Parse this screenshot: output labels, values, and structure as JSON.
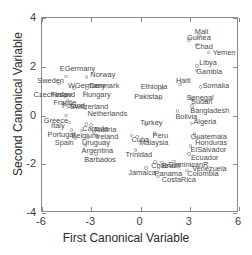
{
  "chart_data": {
    "type": "scatter",
    "title": "",
    "xlabel": "First Canonical Variable",
    "ylabel": "Second Canonical Variable",
    "xlim": [
      -6,
      6
    ],
    "ylim": [
      -4,
      4
    ],
    "xticks": [
      "-6",
      "-3",
      "0",
      "3",
      "6"
    ],
    "xtick_values": [
      -6,
      -3,
      0,
      3,
      6
    ],
    "yticks": [
      "4",
      "2",
      "0",
      "-2",
      "-4"
    ],
    "ytick_values": [
      4,
      2,
      0,
      -2,
      -4
    ],
    "grid": false,
    "legend": null,
    "marker": "open-circle",
    "marker_color": "#9b9b9b",
    "label_color": "#4a4a4a",
    "points": [
      {
        "label": "EGermany",
        "x": -4.55,
        "y": 1.6,
        "lx": -6,
        "ly": -9
      },
      {
        "label": "Sweden",
        "x": -4.95,
        "y": 1.32,
        "lx": -22,
        "ly": -3
      },
      {
        "label": "Norway",
        "x": -3.3,
        "y": 1.58,
        "lx": 4,
        "ly": -3
      },
      {
        "label": "WGermany",
        "x": -4.05,
        "y": 1.12,
        "lx": -6,
        "ly": -3
      },
      {
        "label": "Denmark",
        "x": -3.25,
        "y": 1.12,
        "lx": 2,
        "ly": -3
      },
      {
        "label": "Hungary",
        "x": -3.4,
        "y": 0.95,
        "lx": -2,
        "ly": 2
      },
      {
        "label": "Czechoslov.",
        "x": -5.05,
        "y": 0.82,
        "lx": -24,
        "ly": -2
      },
      {
        "label": "Finland",
        "x": -4.6,
        "y": 0.8,
        "lx": -14,
        "ly": -2
      },
      {
        "label": "France",
        "x": -4.45,
        "y": 0.62,
        "lx": -14,
        "ly": 2
      },
      {
        "label": "Poland",
        "x": -4.3,
        "y": 0.55,
        "lx": -8,
        "ly": 3
      },
      {
        "label": "Switzerland",
        "x": -4.05,
        "y": 0.52,
        "lx": -4,
        "ly": 3
      },
      {
        "label": "Netherlands",
        "x": -3.35,
        "y": 0.28,
        "lx": 2,
        "ly": 4
      },
      {
        "label": "Greece",
        "x": -4.55,
        "y": 0.0,
        "lx": -22,
        "ly": 4
      },
      {
        "label": "Italy",
        "x": -4.35,
        "y": -0.28,
        "lx": -18,
        "ly": 3
      },
      {
        "label": "Canada",
        "x": -3.3,
        "y": -0.35,
        "lx": -4,
        "ly": 4
      },
      {
        "label": "Austria",
        "x": -3.0,
        "y": -0.38,
        "lx": 2,
        "ly": 4
      },
      {
        "label": "Portugal",
        "x": -4.2,
        "y": -0.6,
        "lx": -24,
        "ly": 4
      },
      {
        "label": "Belgium",
        "x": -3.6,
        "y": -0.62,
        "lx": -10,
        "ly": 4
      },
      {
        "label": "Ireland",
        "x": -2.85,
        "y": -0.68,
        "lx": 2,
        "ly": 4
      },
      {
        "label": "Spain",
        "x": -4.0,
        "y": -0.92,
        "lx": -20,
        "ly": 4
      },
      {
        "label": "Uruguay",
        "x": -3.2,
        "y": -0.88,
        "lx": -6,
        "ly": 5
      },
      {
        "label": "Argentina",
        "x": -3.35,
        "y": -1.2,
        "lx": -4,
        "ly": 5
      },
      {
        "label": "Barbados",
        "x": -2.7,
        "y": -1.58,
        "lx": -12,
        "ly": 5
      },
      {
        "label": "Turkey",
        "x": 0.35,
        "y": -0.35,
        "lx": -6,
        "ly": -2
      },
      {
        "label": "Cuba",
        "x": -0.55,
        "y": -0.82,
        "lx": 0,
        "ly": 4
      },
      {
        "label": "Malaysia",
        "x": -0.2,
        "y": -0.88,
        "lx": 2,
        "ly": 5
      },
      {
        "label": "Peru",
        "x": 0.85,
        "y": -0.72,
        "lx": -2,
        "ly": 2
      },
      {
        "label": "Trinidad",
        "x": -0.3,
        "y": -1.42,
        "lx": -10,
        "ly": 4
      },
      {
        "label": "Chile",
        "x": 0.9,
        "y": -1.9,
        "lx": -4,
        "ly": 3
      },
      {
        "label": "Brazil",
        "x": 1.3,
        "y": -1.92,
        "lx": 0,
        "ly": 3
      },
      {
        "label": "Jamaica",
        "x": 0.35,
        "y": -2.15,
        "lx": -18,
        "ly": 4
      },
      {
        "label": "Panama",
        "x": 1.1,
        "y": -2.18,
        "lx": -4,
        "ly": 4
      },
      {
        "label": "CostaRica",
        "x": 1.05,
        "y": -2.5,
        "lx": 4,
        "ly": 3
      },
      {
        "label": "Ethiopia",
        "x": 1.35,
        "y": 1.12,
        "lx": -22,
        "ly": -2
      },
      {
        "label": "Haiti",
        "x": 2.4,
        "y": 1.28,
        "lx": -4,
        "ly": -4
      },
      {
        "label": "Somalia",
        "x": 3.65,
        "y": 1.18,
        "lx": 2,
        "ly": -2
      },
      {
        "label": "Pakistan",
        "x": 1.2,
        "y": 0.7,
        "lx": -26,
        "ly": -2
      },
      {
        "label": "Senegal",
        "x": 3.05,
        "y": 0.72,
        "lx": -4,
        "ly": -1
      },
      {
        "label": "Sudan",
        "x": 3.2,
        "y": 0.68,
        "lx": -2,
        "ly": 2
      },
      {
        "label": "Bangladesh",
        "x": 3.15,
        "y": 0.38,
        "lx": -2,
        "ly": 4
      },
      {
        "label": "Bolivia",
        "x": 2.25,
        "y": 0.18,
        "lx": -2,
        "ly": 5
      },
      {
        "label": "Guinea",
        "x": 2.95,
        "y": 3.1,
        "lx": -2,
        "ly": -3
      },
      {
        "label": "Mali",
        "x": 3.55,
        "y": 3.25,
        "lx": -4,
        "ly": -5
      },
      {
        "label": "Chad",
        "x": 3.45,
        "y": 2.92,
        "lx": -2,
        "ly": 2
      },
      {
        "label": "Yemen",
        "x": 4.15,
        "y": 2.58,
        "lx": 4,
        "ly": -1
      },
      {
        "label": "Libya",
        "x": 3.45,
        "y": 2.02,
        "lx": 2,
        "ly": -4
      },
      {
        "label": "Gambia",
        "x": 3.4,
        "y": 1.85,
        "lx": 0,
        "ly": 1
      },
      {
        "label": "Algeria",
        "x": 3.1,
        "y": -0.32,
        "lx": 2,
        "ly": -2
      },
      {
        "label": "Guatemala",
        "x": 3.3,
        "y": -0.75,
        "lx": -4,
        "ly": 2
      },
      {
        "label": "Honduras",
        "x": 3.45,
        "y": -0.92,
        "lx": -2,
        "ly": 4
      },
      {
        "label": "ElSalvador",
        "x": 3.05,
        "y": -1.25,
        "lx": 0,
        "ly": 3
      },
      {
        "label": "Ecuador",
        "x": 2.95,
        "y": -1.58,
        "lx": 2,
        "ly": 3
      },
      {
        "label": "DominicanR.",
        "x": 2.05,
        "y": -1.88,
        "lx": -6,
        "ly": 3
      },
      {
        "label": "Venezuela",
        "x": 3.15,
        "y": -2.05,
        "lx": 0,
        "ly": 3
      },
      {
        "label": "Colombia",
        "x": 2.85,
        "y": -2.25,
        "lx": 0,
        "ly": 3
      }
    ]
  }
}
